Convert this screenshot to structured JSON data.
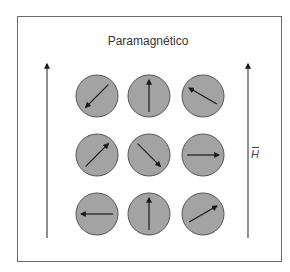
{
  "title": "Paramagnético",
  "field_label": "H",
  "colors": {
    "circle_fill": "#a3a3a3",
    "circle_stroke": "#555555",
    "arrow": "#1a1a1a",
    "frame": "#6a6a6a"
  },
  "spins": [
    {
      "row": 0,
      "col": 0,
      "direction": "down-left",
      "angle_deg": 225
    },
    {
      "row": 0,
      "col": 1,
      "direction": "up",
      "angle_deg": 90
    },
    {
      "row": 0,
      "col": 2,
      "direction": "up-left",
      "angle_deg": 150
    },
    {
      "row": 1,
      "col": 0,
      "direction": "up-right",
      "angle_deg": 45
    },
    {
      "row": 1,
      "col": 1,
      "direction": "down-right",
      "angle_deg": -45
    },
    {
      "row": 1,
      "col": 2,
      "direction": "right",
      "angle_deg": 0
    },
    {
      "row": 2,
      "col": 0,
      "direction": "left",
      "angle_deg": 180
    },
    {
      "row": 2,
      "col": 1,
      "direction": "up",
      "angle_deg": 90
    },
    {
      "row": 2,
      "col": 2,
      "direction": "up-right",
      "angle_deg": 30
    }
  ],
  "field_arrows": [
    {
      "side": "left",
      "direction": "up"
    },
    {
      "side": "right",
      "direction": "up"
    }
  ]
}
